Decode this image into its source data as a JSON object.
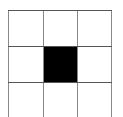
{
  "grid": {
    "rows": 3,
    "cols": 3,
    "filled_cells": [
      {
        "row": 1,
        "col": 1,
        "color": "#000000"
      }
    ],
    "line_color": "#777777",
    "background": "#ffffff"
  }
}
